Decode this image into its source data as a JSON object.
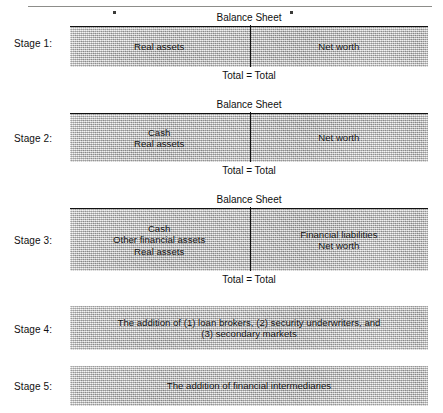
{
  "figure": {
    "sheet_caption": "Balance Sheet",
    "total_caption": "Total = Total",
    "stages": [
      {
        "label": "Stage 1:",
        "type": "balance-sheet",
        "left_lines": [
          "Real assets"
        ],
        "right_lines": [
          "Net worth"
        ]
      },
      {
        "label": "Stage 2:",
        "type": "balance-sheet",
        "left_lines": [
          "Cash",
          "Real assets"
        ],
        "right_lines": [
          "Net worth"
        ]
      },
      {
        "label": "Stage 3:",
        "type": "balance-sheet",
        "left_lines": [
          "Cash",
          "Other financial assets",
          "Real assets"
        ],
        "right_lines": [
          "Financial liabilities",
          "Net worth"
        ]
      },
      {
        "label": "Stage 4:",
        "type": "note",
        "note_lines": [
          "The addition of (1) loan brokers, (2) security underwriters, and",
          "(3) secondary markets"
        ]
      },
      {
        "label": "Stage 5:",
        "type": "note",
        "note_lines": [
          "The addition of financial intermediaries"
        ]
      }
    ]
  },
  "stage1": {
    "label": "Stage 1:",
    "sheet_caption": "Balance Sheet",
    "total_caption": "Total = Total",
    "left_1": "Real assets",
    "right_1": "Net worth"
  },
  "stage2": {
    "label": "Stage 2:",
    "sheet_caption": "Balance Sheet",
    "total_caption": "Total = Total",
    "left_1": "Cash",
    "left_2": "Real assets",
    "right_1": "Net worth"
  },
  "stage3": {
    "label": "Stage 3:",
    "sheet_caption": "Balance Sheet",
    "total_caption": "Total = Total",
    "left_1": "Cash",
    "left_2": "Other financial assets",
    "left_3": "Real assets",
    "right_1": "Financial liabilities",
    "right_2": "Net worth"
  },
  "stage4": {
    "label": "Stage 4:",
    "note_1": "The addition of (1) loan brokers, (2) security underwriters, and",
    "note_2": "(3) secondary markets"
  },
  "stage5": {
    "label": "Stage 5:",
    "note_1": "The addition of financial intermediaries"
  },
  "colors": {
    "bar_fill": "#b4b4b4",
    "rule": "#111111",
    "text": "#101010",
    "top_rule": "#8d8d8a",
    "background": "#ffffff"
  }
}
